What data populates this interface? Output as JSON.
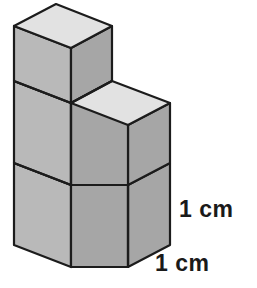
{
  "figure": {
    "background_color": "#ffffff",
    "cube_count": 4,
    "colors": {
      "top_face": "#e2e2e2",
      "left_face": "#b9b9b9",
      "right_face": "#a6a6a6",
      "edge_stroke": "#1c1c1c",
      "label_text": "#1a1a1a"
    },
    "edge_width": 2.2
  },
  "labels": {
    "height": "1 cm",
    "width": "1 cm"
  },
  "geometry": {
    "unit_half_width": 57,
    "unit_depth_rise": 22,
    "unit_height": 82,
    "origin_x": 14,
    "origin_y": 245,
    "cubes": [
      {
        "name": "bottom-left",
        "col": 0,
        "row": 0
      },
      {
        "name": "bottom-right",
        "col": 1,
        "row": 0
      },
      {
        "name": "top-left",
        "col": 0,
        "row": 1
      },
      {
        "name": "top-left-upper",
        "col": 0,
        "row": 2
      }
    ]
  }
}
